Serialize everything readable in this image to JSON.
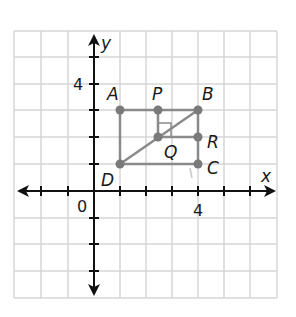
{
  "axes": {
    "x_label": "x",
    "y_label": "y",
    "origin_label": "0",
    "x_tick_label": "4",
    "y_tick_label": "4"
  },
  "points": {
    "A": {
      "label": "A",
      "x": 1,
      "y": 3
    },
    "P": {
      "label": "P",
      "x": 2.5,
      "y": 3
    },
    "B": {
      "label": "B",
      "x": 4,
      "y": 3
    },
    "Q": {
      "label": "Q",
      "x": 2.5,
      "y": 2
    },
    "R": {
      "label": "R",
      "x": 4,
      "y": 2
    },
    "D": {
      "label": "D",
      "x": 1,
      "y": 1
    },
    "C": {
      "label": "C",
      "x": 4,
      "y": 1
    }
  },
  "segments": [
    "AB",
    "BC",
    "CD",
    "DA",
    "DB",
    "PQ",
    "QR"
  ],
  "right_angle_at": "Q",
  "colors": {
    "grid": "#d4d4d4",
    "axis": "#111111",
    "figure": "#8a8a8a",
    "point": "#7a7a7a"
  }
}
